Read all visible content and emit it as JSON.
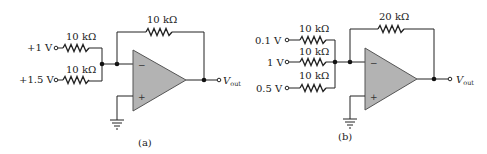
{
  "circuits": [
    {
      "id": "a",
      "caption": "(a)",
      "inputs": [
        {
          "voltage": "+1 V",
          "resistor": "10 kΩ"
        },
        {
          "voltage": "+1.5 V",
          "resistor": "10 kΩ"
        }
      ],
      "feedback_resistor": "10 kΩ",
      "inverting_sign": "−",
      "noninverting_sign": "+",
      "output_label": "V",
      "output_subscript": "out"
    },
    {
      "id": "b",
      "caption": "(b)",
      "inputs": [
        {
          "voltage": "0.1 V",
          "resistor": "10 kΩ"
        },
        {
          "voltage": "1 V",
          "resistor": "10 kΩ"
        },
        {
          "voltage": "0.5 V",
          "resistor": "10 kΩ"
        }
      ],
      "feedback_resistor": "20 kΩ",
      "inverting_sign": "−",
      "noninverting_sign": "+",
      "output_label": "V",
      "output_subscript": "out"
    }
  ]
}
